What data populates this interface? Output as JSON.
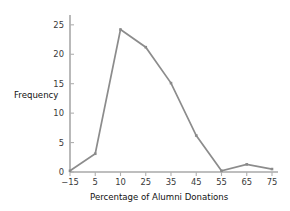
{
  "chart_data": {
    "type": "line",
    "title": "",
    "subtitle": "",
    "xlabel": "Percentage of Alumni Donations",
    "ylabel": "Frequency",
    "categories": [
      "−15",
      "5",
      "10",
      "25",
      "35",
      "45",
      "55",
      "65",
      "75"
    ],
    "values": [
      0.2,
      3.1,
      24.2,
      21.2,
      15.1,
      6.2,
      0.2,
      1.3,
      0.5
    ],
    "series": [
      {
        "name": "Frequency",
        "values": [
          0.2,
          3.1,
          24.2,
          21.2,
          15.1,
          6.2,
          0.2,
          1.3,
          0.5
        ]
      }
    ],
    "x_tick_labels": [
      "−15",
      "5",
      "10",
      "25",
      "35",
      "45",
      "55",
      "65",
      "75"
    ],
    "y_tick_labels": [
      "0",
      "5",
      "10",
      "15",
      "20",
      "25"
    ],
    "y_ticks": [
      0,
      5,
      10,
      15,
      20,
      25
    ],
    "ylim": [
      0,
      26.5
    ],
    "grid": false,
    "legend": false,
    "legend_position": "none",
    "marker": "square",
    "line_color": "#8c8c8c",
    "marker_color": "#8a8a8a",
    "axis_color": "#a8a8a8",
    "background_color": "#ffffff",
    "annotations": []
  },
  "axis_titles": {
    "x": "Percentage of Alumni Donations",
    "y": "Frequency"
  }
}
